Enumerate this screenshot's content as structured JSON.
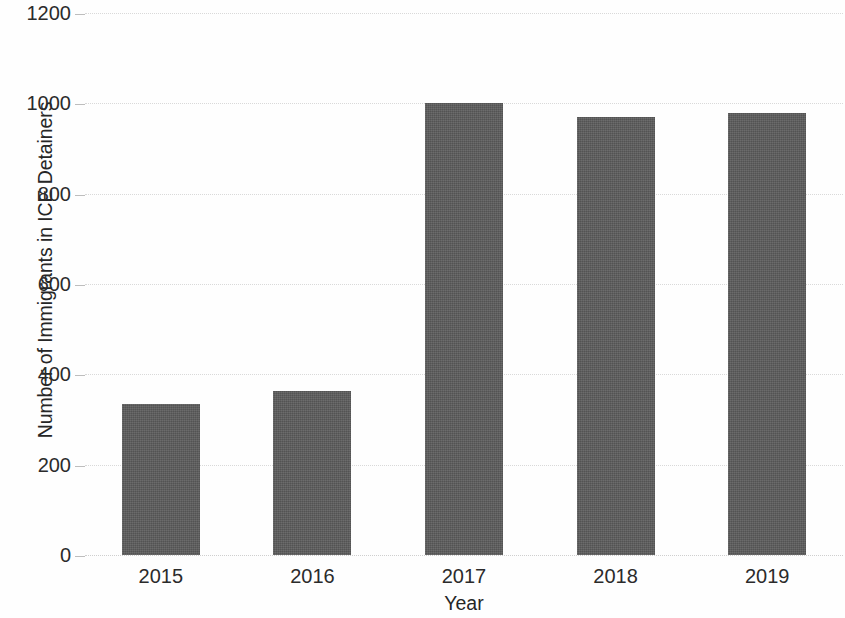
{
  "chart_data": {
    "type": "bar",
    "title": "",
    "xlabel": "Year",
    "ylabel": "Number of Immigrants in ICE Detainers",
    "categories": [
      "2015",
      "2016",
      "2017",
      "2018",
      "2019"
    ],
    "values": [
      334,
      363,
      1001,
      970,
      978
    ],
    "series": [
      {
        "name": "Number of Immigrants in ICE Detainers",
        "values": [
          334,
          363,
          1001,
          970,
          978
        ]
      }
    ],
    "ylim": [
      0,
      1200
    ],
    "yticks": [
      0,
      200,
      400,
      600,
      800,
      1000,
      1200
    ],
    "ytick_labels": [
      "0",
      "200",
      "400",
      "600",
      "800",
      "1000",
      "1200"
    ],
    "grid": true,
    "grid_axis": "y",
    "legend": false,
    "legend_position": "none",
    "bar_color": "#5b5b5b",
    "background_color": "#fefefe",
    "gridline_color": "#d9d9d9",
    "text_color": "#2b2b2b"
  }
}
